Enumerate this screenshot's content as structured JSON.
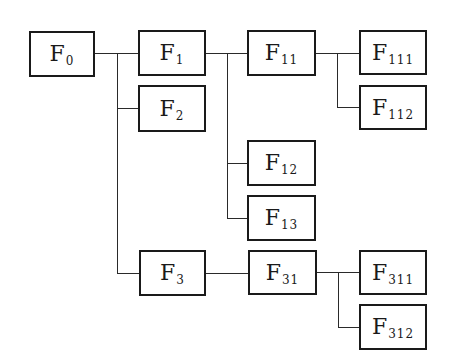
{
  "diagram": {
    "type": "hierarchy-tree",
    "root": "F0",
    "nodes": [
      {
        "id": "F0",
        "letter": "F",
        "sub": "0",
        "parent": null
      },
      {
        "id": "F1",
        "letter": "F",
        "sub": "1",
        "parent": "F0"
      },
      {
        "id": "F2",
        "letter": "F",
        "sub": "2",
        "parent": "F0"
      },
      {
        "id": "F3",
        "letter": "F",
        "sub": "3",
        "parent": "F0"
      },
      {
        "id": "F11",
        "letter": "F",
        "sub": "11",
        "parent": "F1"
      },
      {
        "id": "F12",
        "letter": "F",
        "sub": "12",
        "parent": "F1"
      },
      {
        "id": "F13",
        "letter": "F",
        "sub": "13",
        "parent": "F1"
      },
      {
        "id": "F111",
        "letter": "F",
        "sub": "111",
        "parent": "F11"
      },
      {
        "id": "F112",
        "letter": "F",
        "sub": "112",
        "parent": "F11"
      },
      {
        "id": "F31",
        "letter": "F",
        "sub": "31",
        "parent": "F3"
      },
      {
        "id": "F311",
        "letter": "F",
        "sub": "311",
        "parent": "F31"
      },
      {
        "id": "F312",
        "letter": "F",
        "sub": "312",
        "parent": "F31"
      }
    ]
  }
}
